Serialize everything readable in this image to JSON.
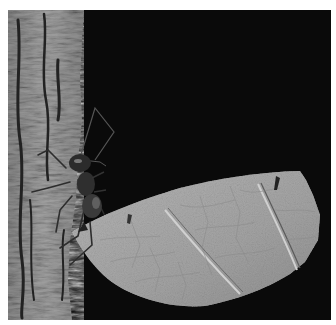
{
  "image": {
    "description": "Grayscale macro photograph of a leafcutter ant on tree bark holding a cut leaf fragment against a black background",
    "subject": "leafcutter ant carrying leaf",
    "style": "grayscale",
    "colors": {
      "page_border": "#ffffff",
      "background": "#0b0b0b",
      "bark_light": "#9a9a9a",
      "bark_dark": "#3a3a3a",
      "leaf": "#a8a8a8",
      "leaf_vein": "#c8c8c8",
      "ant": "#2a2a2a"
    }
  }
}
